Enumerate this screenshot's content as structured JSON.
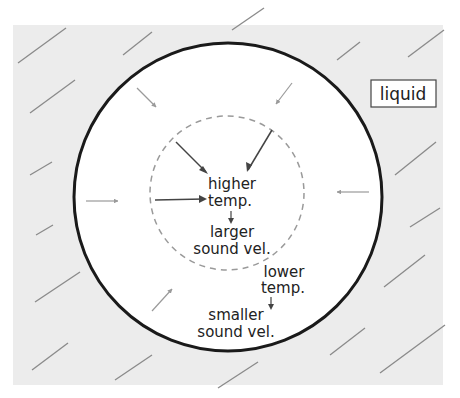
{
  "diagram": {
    "type": "cross-section schematic",
    "colors": {
      "background": "#ffffff",
      "liquid_fill": "#ececec",
      "outer_boundary": "#1a1a1a",
      "inner_dashed_circle": "#999999",
      "hatch_lines": "#8a8a8a",
      "arrows": "#444444",
      "text": "#222222"
    },
    "liquid_label": "liquid",
    "center_label": {
      "line1": "higher",
      "line2": "temp.",
      "line3": "larger",
      "line4": "sound vel."
    },
    "edge_label": {
      "line1": "lower",
      "line2": "temp.",
      "line3": "smaller",
      "line4": "sound vel."
    }
  }
}
